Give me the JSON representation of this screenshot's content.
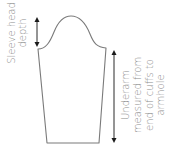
{
  "diagram": {
    "colors": {
      "outline": "#7a7a7a",
      "arrow": "#2a2a2a",
      "text": "#8a8a8a",
      "background": "#ffffff"
    },
    "labels": {
      "sleeve_head": {
        "line1": "Sleeve head",
        "line2": "depth"
      },
      "underarm": {
        "line1": "Underarm",
        "line2": "measured from",
        "line3": "end of cuffs to",
        "line4": "armhole"
      }
    }
  }
}
